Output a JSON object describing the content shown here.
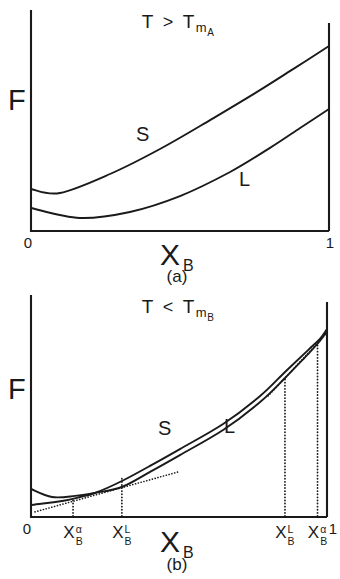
{
  "style": {
    "line_color": "#1a1a1a",
    "background": "#ffffff"
  },
  "panels": {
    "a": {
      "title": {
        "lhs": "T",
        "op": ">",
        "base": "T",
        "sub": "m",
        "subsub": "A"
      },
      "ylabel": "F",
      "xlabel": {
        "base": "X",
        "sub": "B"
      },
      "caption": "(a)"
    },
    "b": {
      "title": {
        "lhs": "T",
        "op": "<",
        "base": "T",
        "sub": "m",
        "subsub": "B"
      },
      "ylabel": "F",
      "xlabel": {
        "base": "X",
        "sub": "B"
      },
      "caption": "(b)"
    }
  },
  "chart_data": [
    {
      "type": "line",
      "panel": "a",
      "title": "T > T_m_A",
      "xlabel": "X_B",
      "ylabel": "F (arbitrary units)",
      "xlim": [
        0,
        1
      ],
      "grid": false,
      "description": "Molar free energy vs composition: liquid curve L lies entirely below solid curve S, so liquid is stable at all compositions.",
      "series": [
        {
          "name": "S",
          "x": [
            0.0,
            0.097,
            0.265,
            0.433,
            0.601,
            0.752,
            0.886,
            1.0
          ],
          "f": [
            0.19,
            0.172,
            0.258,
            0.371,
            0.502,
            0.624,
            0.738,
            0.837
          ],
          "label_px": [
            136,
            124
          ]
        },
        {
          "name": "L",
          "x": [
            0.0,
            0.164,
            0.332,
            0.5,
            0.668,
            0.802,
            0.903,
            1.0
          ],
          "f": [
            0.104,
            0.059,
            0.086,
            0.158,
            0.267,
            0.376,
            0.466,
            0.552
          ],
          "label_px": [
            239,
            169
          ]
        }
      ],
      "tangents": [],
      "guides": [],
      "xticks": [
        {
          "id": "0",
          "text": "0",
          "x": -0.01
        },
        {
          "id": "1",
          "text": "1",
          "x": 1.003
        }
      ],
      "plot_px": {
        "x_left": 31,
        "x_right": 329,
        "y_base": 231,
        "y_top": 10,
        "y_axis_top": 10,
        "border_top": 23
      }
    },
    {
      "type": "line",
      "panel": "b",
      "title": "T < T_m_B",
      "xlabel": "X_B",
      "ylabel": "F (arbitrary units)",
      "xlim": [
        0,
        1
      ],
      "grid": false,
      "description": "Solid and liquid free-energy curves cross twice; dotted common tangents define two-phase regions with compositions X_B_alpha and X_B_L on each side.",
      "series": [
        {
          "name": "S",
          "x": [
            0.0,
            0.105,
            0.166,
            0.216,
            0.307,
            0.402,
            0.503,
            0.649,
            0.774,
            0.858,
            0.936,
            0.976,
            1.0
          ],
          "f": [
            0.054,
            0.072,
            0.09,
            0.108,
            0.162,
            0.23,
            0.306,
            0.419,
            0.545,
            0.653,
            0.752,
            0.802,
            0.847
          ],
          "label_px": [
            158,
            129
          ]
        },
        {
          "name": "L",
          "x": [
            0.0,
            0.071,
            0.149,
            0.216,
            0.307,
            0.402,
            0.503,
            0.649,
            0.774,
            0.858,
            0.936,
            0.976,
            1.0
          ],
          "f": [
            0.126,
            0.09,
            0.095,
            0.108,
            0.135,
            0.203,
            0.279,
            0.392,
            0.518,
            0.626,
            0.734,
            0.793,
            0.838
          ],
          "label_px": [
            224,
            127
          ]
        }
      ],
      "tangents": [
        {
          "id": "left-common-tangent",
          "x1": 0.0135,
          "f1": 0.023,
          "x2": 0.497,
          "f2": 0.203
        },
        {
          "id": "right-common-tangent",
          "x1": 0.801,
          "f1": 0.545,
          "x2": 1.0,
          "f2": 0.829
        }
      ],
      "guides": [
        {
          "id": "xb-alpha-left",
          "x": 0.142,
          "f_top": 0.077
        },
        {
          "id": "xb-L-left",
          "x": 0.307,
          "f_top": 0.176
        },
        {
          "id": "xb-L-right",
          "x": 0.858,
          "f_top": 0.626
        },
        {
          "id": "xb-alpha-right",
          "x": 0.968,
          "f_top": 0.784
        }
      ],
      "xticks": [
        {
          "id": "0",
          "text": "0",
          "x": -0.0135
        },
        {
          "id": "xb-alpha-left",
          "base": "X",
          "sup": "α",
          "sub": "B",
          "x": 0.142
        },
        {
          "id": "xb-L-left",
          "base": "X",
          "sup": "L",
          "sub": "B",
          "x": 0.307
        },
        {
          "id": "xb-L-right",
          "base": "X",
          "sup": "L",
          "sub": "B",
          "x": 0.858
        },
        {
          "id": "xb-alpha-right",
          "base": "X",
          "sup": "α",
          "sub": "B",
          "x": 0.968
        },
        {
          "id": "1",
          "text": "1",
          "x": 1.02
        }
      ],
      "plot_px": {
        "x_left": 31,
        "x_right": 327,
        "y_base": 228,
        "y_top": 6,
        "y_axis_top": 6,
        "border_top": 13
      }
    }
  ]
}
